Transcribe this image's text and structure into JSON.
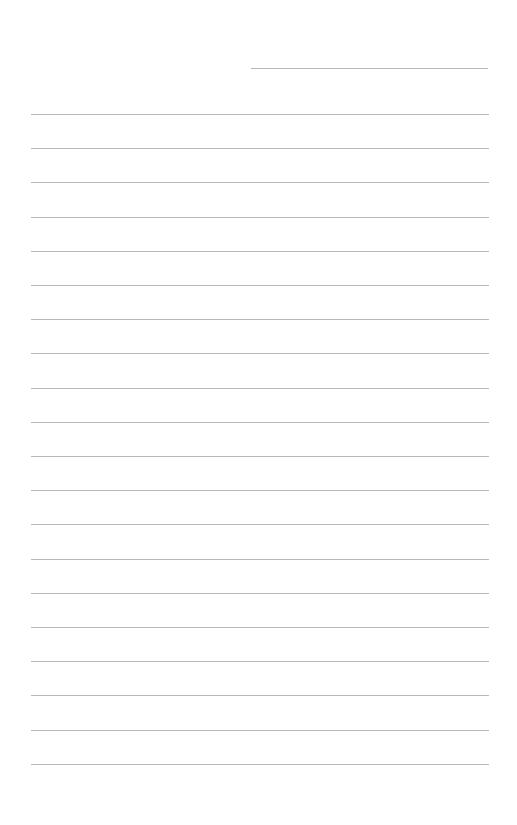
{
  "page": {
    "type": "lined-paper",
    "background": "#ffffff",
    "line_color": "#b8b8b8",
    "header_line": {
      "x1": 251,
      "x2": 488,
      "y": 68
    },
    "ruled_lines": {
      "count": 20,
      "x1": 31,
      "x2": 489,
      "first_y": 114,
      "spacing": 34.2
    }
  }
}
